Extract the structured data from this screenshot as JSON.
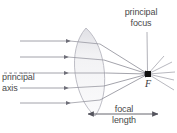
{
  "figure": {
    "title_fragment": "Fig.",
    "type": "converging-lens-ray-diagram",
    "labels": {
      "principal_focus": "principal\nfocus",
      "principal_focus_line1": "principal",
      "principal_focus_line2": "focus",
      "principal_axis_line1": "principal",
      "principal_axis_line2": "axis",
      "focal_length_line1": "focal",
      "focal_length_line2": "length",
      "focus_point": "F"
    },
    "colors": {
      "ray": "#8c8c96",
      "lens_stroke": "#b4b4bc",
      "lens_fill": "#f0f0f2",
      "lens_fill_dark": "#e2e2e6",
      "axis": "#8c8c96",
      "text": "#4a4a4a",
      "focus_dot": "#101010",
      "background": "#ffffff",
      "arrow": "#55555e"
    },
    "geometry": {
      "focus_x": 148,
      "focus_y": 74,
      "lens_center_x": 86,
      "lens_center_y": 72,
      "lens_top_y": 28,
      "lens_bottom_y": 116,
      "focal_length_arrow_y": 114,
      "focal_length_arrow_x_start": 88,
      "focal_length_arrow_x_end": 158,
      "incoming_ray_count": 5,
      "ray_y_positions": [
        41,
        57,
        73,
        88,
        103
      ],
      "ray_start_x": 20,
      "principal_axis_y": 73
    }
  }
}
